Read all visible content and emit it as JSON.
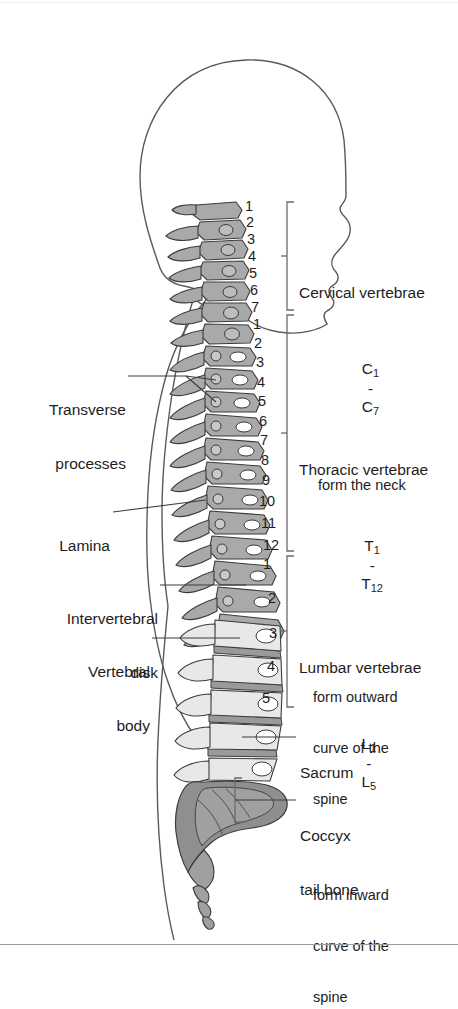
{
  "figure": {
    "colors": {
      "outline": "#4a4a4a",
      "body_contour": "#5a5a5a",
      "vertebra_cervical": "#a9a9a9",
      "vertebra_thoracic": "#a9a9a9",
      "vertebra_lumbar": "#e8e8e8",
      "disk": "#9a9a9a",
      "sacrum": "#8f8f8f",
      "coccyx": "#a0a0a0",
      "leader_line": "#3c3c3c",
      "bracket": "#6b6b6b",
      "text": "#1d1d1d",
      "rule": "#9a9a9a"
    }
  },
  "left_labels": [
    {
      "name": "transverse-processes",
      "lines": [
        "Transverse",
        "processes"
      ]
    },
    {
      "name": "lamina",
      "lines": [
        "Lamina"
      ]
    },
    {
      "name": "intervertebral-disk",
      "lines": [
        "Intervertebral",
        "disk"
      ]
    },
    {
      "name": "vertebral-body",
      "lines": [
        "Vertebral",
        "body"
      ]
    }
  ],
  "regions": [
    {
      "name": "cervical",
      "title": "Cervical vertebrae",
      "range_prefix": "C",
      "range_from": "1",
      "range_to": "7",
      "description": [
        "form the neck"
      ],
      "numbers": [
        "1",
        "2",
        "3",
        "4",
        "5",
        "6",
        "7"
      ]
    },
    {
      "name": "thoracic",
      "title": "Thoracic vertebrae",
      "range_prefix": "T",
      "range_from": "1",
      "range_to": "12",
      "description": [
        "form outward",
        "curve of the",
        "spine"
      ],
      "numbers": [
        "1",
        "2",
        "3",
        "4",
        "5",
        "6",
        "7",
        "8",
        "9",
        "10",
        "11",
        "12"
      ]
    },
    {
      "name": "lumbar",
      "title": "Lumbar vertebrae",
      "range_prefix": "L",
      "range_from": "1",
      "range_to": "5",
      "description": [
        "form inward",
        "curve of the",
        "spine"
      ],
      "numbers": [
        "1",
        "2",
        "3",
        "4",
        "5"
      ]
    }
  ],
  "lower_labels": [
    {
      "name": "sacrum",
      "lines": [
        "Sacrum"
      ]
    },
    {
      "name": "coccyx",
      "lines": [
        "Coccyx",
        "tail bone"
      ]
    }
  ]
}
